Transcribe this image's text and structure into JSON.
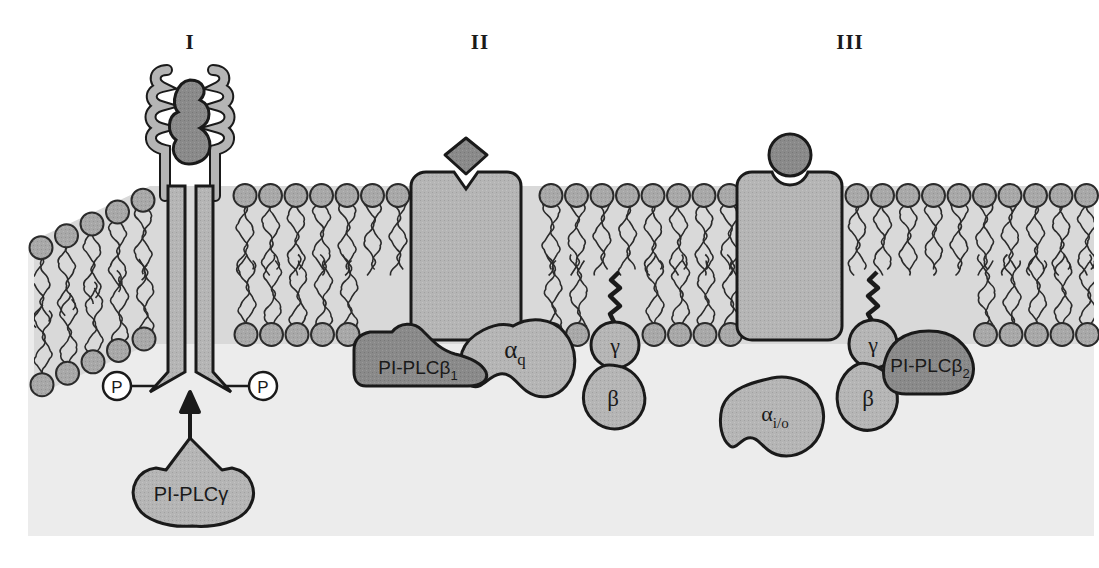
{
  "figure": {
    "background_color": "#ffffff",
    "cytoplasm_color": "#ececec",
    "membrane_tail_color": "#d3d3d3",
    "lipid_head_color": "#a8a8a8",
    "protein_light_color": "#b5b5b5",
    "protein_dark_color": "#8a8a8a",
    "outline_color": "#1a1a1a"
  },
  "panels": [
    {
      "numeral": "I",
      "x": 190,
      "mechanism": "receptor-tyrosine-kinase",
      "enzyme": "PI-PLCγ"
    },
    {
      "numeral": "II",
      "x": 480,
      "mechanism": "gq-coupled-receptor",
      "enzyme": "PI-PLCβ₁"
    },
    {
      "numeral": "III",
      "x": 850,
      "mechanism": "gi-o-coupled-receptor-betagamma",
      "enzyme": "PI-PLCβ₂"
    }
  ],
  "labels": {
    "plc_gamma": "PI-PLCγ",
    "plc_beta1_main": "PI-PLCβ",
    "plc_beta1_sub": "1",
    "plc_beta2_main": "PI-PLCβ",
    "plc_beta2_sub": "2",
    "alpha_q_main": "α",
    "alpha_q_sub": "q",
    "alpha_io_main": "α",
    "alpha_io_sub": "i/o",
    "beta_mid": "β",
    "gamma_mid": "γ",
    "beta_right": "β",
    "gamma_right": "γ",
    "phosphate_left": "P",
    "phosphate_right": "P"
  },
  "elements": {
    "rtk_receptor": "receptor-tyrosine-kinase-dimer",
    "rtk_ligand": "growth-factor-ligand",
    "gpcr_ii": "seven-transmembrane-receptor",
    "gpcr_ii_ligand": "diamond-agonist-ligand",
    "gpcr_iii": "seven-transmembrane-receptor",
    "gpcr_iii_ligand": "round-agonist-ligand",
    "gamma_prenyl_anchor": "isoprenyl-lipid-anchor",
    "activation_arrow": "translocation-arrow"
  }
}
